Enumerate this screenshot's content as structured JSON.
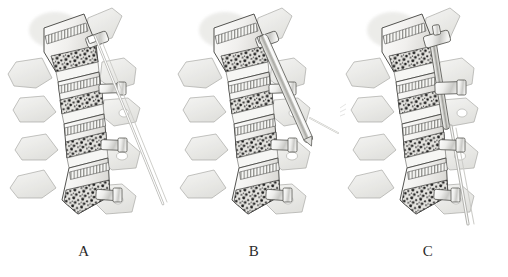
{
  "figure": {
    "type": "medical-illustration",
    "style": "graphite pencil anatomical drawing",
    "background_color": "#ffffff",
    "ink_color": "#3a3a3a",
    "bone_fill": "#f2f2f0",
    "bone_shade": "#cfcfcc",
    "lesion_color": "#1e1e1e",
    "metal_color": "#e6e6e4",
    "panel_count": 3,
    "panels": [
      {
        "id": "A",
        "caption": "A",
        "description": "Lumbar vertebrae with guidewire (K-wire) passing diagonally through the superior pedicle screw head",
        "instrument": "guidewire",
        "instrument_label": "K-wire / guidewire",
        "vertebra_count": 4,
        "screw_count": 3
      },
      {
        "id": "B",
        "caption": "B",
        "description": "Cannulated tube / screwdriver sleeve advanced over the guidewire into the superior pedicle screw",
        "instrument": "cannulated-driver",
        "instrument_label": "cannulated driver sleeve",
        "vertebra_count": 4,
        "screw_count": 3
      },
      {
        "id": "C",
        "caption": "C",
        "description": "Longitudinal rod seated and locked between the two cephalad pedicle screws with rod inserter in place",
        "instrument": "rod-inserter",
        "instrument_label": "rod and rod inserter",
        "vertebra_count": 4,
        "screw_count": 3
      }
    ]
  },
  "captions": {
    "a": "A",
    "b": "B",
    "c": "C"
  }
}
